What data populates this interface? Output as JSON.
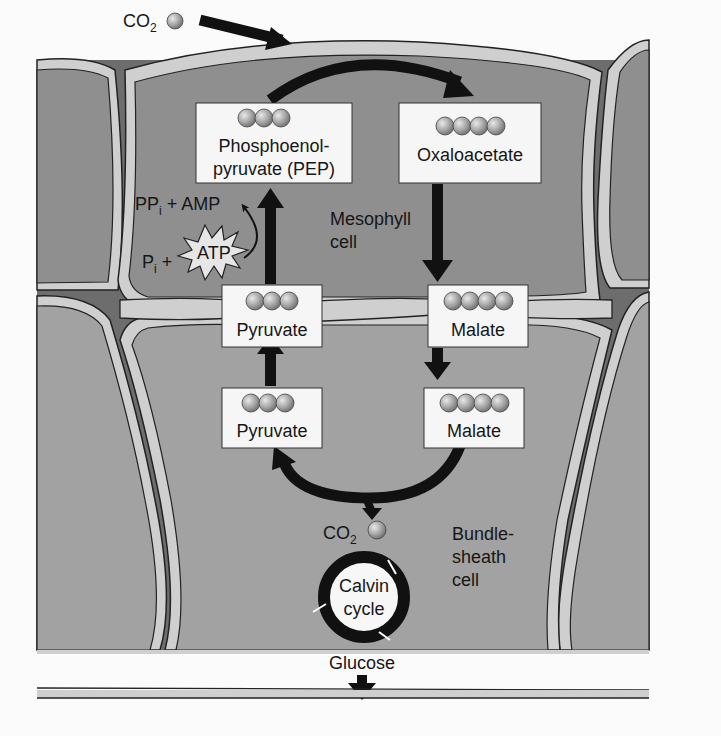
{
  "diagram": {
    "colors": {
      "background": "#fbfbfb",
      "cell_fill": "#8f8f8f",
      "cell_fill_light": "#a2a2a2",
      "wall": "#cfcfcf",
      "intercellular": "#6d6d6d",
      "arrow": "#111111",
      "box_fill": "#f6f6f6",
      "molecule": "#a9a9a9"
    },
    "co2_in": {
      "label": "CO",
      "sub": "2"
    },
    "boxes": {
      "pep": {
        "line1": "Phosphoenol-",
        "line2": "pyruvate (PEP)",
        "carbons": 3
      },
      "oxaloacetate": {
        "label": "Oxaloacetate",
        "carbons": 4
      },
      "pyruvate_meso": {
        "label": "Pyruvate",
        "carbons": 3
      },
      "malate_meso": {
        "label": "Malate",
        "carbons": 4
      },
      "pyruvate_bundle": {
        "label": "Pyruvate",
        "carbons": 3
      },
      "malate_bundle": {
        "label": "Malate",
        "carbons": 4
      }
    },
    "atp_reaction": {
      "products": {
        "pp": "PP",
        "pp_sub": "i",
        "rest": " + AMP"
      },
      "reactants": {
        "p": "P",
        "p_sub": "i",
        "plus": " +"
      },
      "atp_label": "ATP"
    },
    "cells": {
      "mesophyll": {
        "line1": "Mesophyll",
        "line2": "cell"
      },
      "bundle_sheath": {
        "line1": "Bundle-",
        "line2": "sheath",
        "line3": "cell"
      }
    },
    "co2_released": {
      "label": "CO",
      "sub": "2"
    },
    "calvin": {
      "line1": "Calvin",
      "line2": "cycle"
    },
    "output": {
      "label": "Glucose"
    }
  }
}
